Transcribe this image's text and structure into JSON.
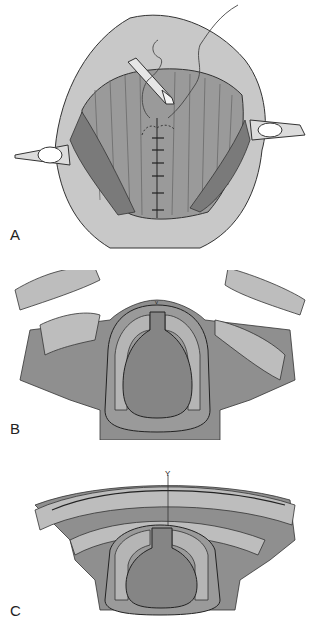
{
  "figure": {
    "panels": [
      {
        "id": "A",
        "label": "A",
        "description": "Open surgical view with retractors, needle holder and interrupted midline sutures"
      },
      {
        "id": "B",
        "label": "B",
        "description": "Cross-section before closure: muscle flaps retracted laterally"
      },
      {
        "id": "C",
        "label": "C",
        "description": "Cross-section after layered closure over midline"
      }
    ],
    "colors": {
      "skin": "#c8c8c8",
      "muscle": "#8f8f8f",
      "dark_muscle": "#7a7a7a",
      "fat_lobules": "#bdbdbd",
      "cartilage": "#b5b5b5",
      "lumen": "#858585",
      "outline": "#2a2a2a",
      "background": "#ffffff"
    }
  }
}
